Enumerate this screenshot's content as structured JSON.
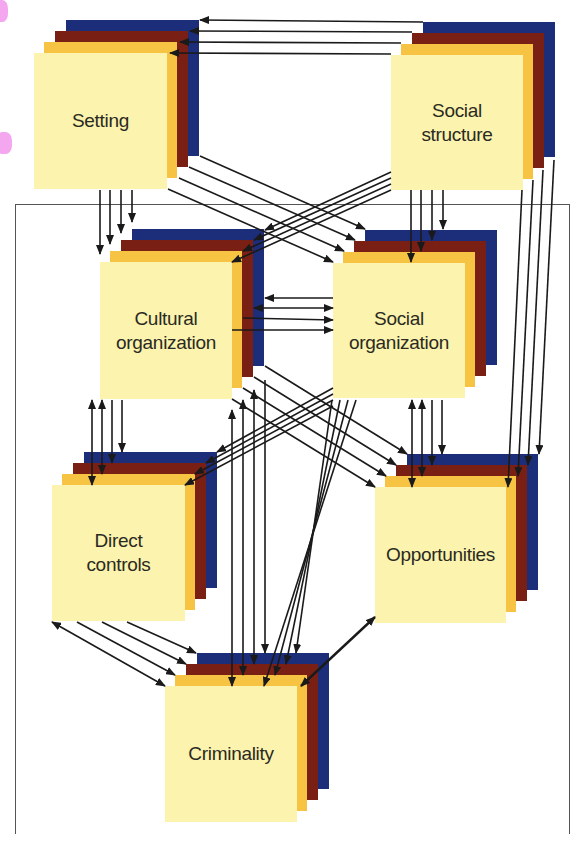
{
  "diagram": {
    "type": "causal-flow",
    "colors": {
      "front": "#fbf3ae",
      "gold": "#f7c343",
      "red": "#7a1f14",
      "blue": "#1c2d7a",
      "arrow": "#1a1a1a",
      "frame": "#555555"
    },
    "nodes": [
      {
        "id": "setting",
        "label": "Setting"
      },
      {
        "id": "social_structure",
        "label": "Social\nstructure"
      },
      {
        "id": "cultural_organization",
        "label": "Cultural\norganization"
      },
      {
        "id": "social_organization",
        "label": "Social\norganization"
      },
      {
        "id": "direct_controls",
        "label": "Direct\ncontrols"
      },
      {
        "id": "opportunities",
        "label": "Opportunities"
      },
      {
        "id": "criminality",
        "label": "Criminality"
      }
    ],
    "edges": [
      {
        "from": "social_structure",
        "to": "setting",
        "count": 4
      },
      {
        "from": "setting",
        "to": "cultural_organization",
        "count": 4
      },
      {
        "from": "setting",
        "to": "social_organization",
        "count": 4
      },
      {
        "from": "social_structure",
        "to": "cultural_organization",
        "count": 4
      },
      {
        "from": "social_structure",
        "to": "social_organization",
        "count": 4
      },
      {
        "from": "social_structure",
        "to": "opportunities",
        "count": 4
      },
      {
        "from": "cultural_organization",
        "to": "social_organization",
        "count": 4,
        "bidirectional": true
      },
      {
        "from": "cultural_organization",
        "to": "direct_controls",
        "count": 4,
        "bidirectional": true
      },
      {
        "from": "cultural_organization",
        "to": "opportunities",
        "count": 4
      },
      {
        "from": "cultural_organization",
        "to": "criminality",
        "count": 4,
        "bidirectional": true
      },
      {
        "from": "social_organization",
        "to": "direct_controls",
        "count": 4
      },
      {
        "from": "social_organization",
        "to": "opportunities",
        "count": 4,
        "bidirectional": true
      },
      {
        "from": "social_organization",
        "to": "criminality",
        "count": 4
      },
      {
        "from": "direct_controls",
        "to": "criminality",
        "count": 4,
        "bidirectional": true
      },
      {
        "from": "opportunities",
        "to": "criminality",
        "count": 1,
        "bidirectional": true
      }
    ]
  }
}
